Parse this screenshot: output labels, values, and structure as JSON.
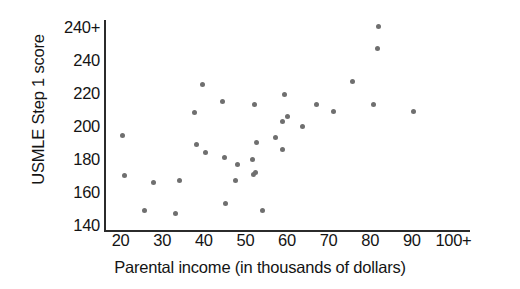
{
  "chart_data": {
    "type": "scatter",
    "title": "",
    "xlabel": "Parental income (in thousands of dollars)",
    "ylabel": "USMLE Step 1 score",
    "xticks": [
      "20",
      "30",
      "40",
      "50",
      "60",
      "70",
      "80",
      "90",
      "100+"
    ],
    "xtick_values": [
      20,
      30,
      40,
      50,
      60,
      70,
      80,
      90,
      100
    ],
    "yticks": [
      "140",
      "160",
      "180",
      "200",
      "220",
      "240",
      "240+"
    ],
    "ytick_values": [
      140,
      160,
      180,
      200,
      220,
      240,
      260
    ],
    "xlim": [
      16,
      104
    ],
    "ylim": [
      136,
      264
    ],
    "grid": false,
    "legend": null,
    "marker": {
      "shape": "circle",
      "color": "#6f6f6f",
      "size_px": 5
    },
    "axis_color": "#2b2b2b",
    "background": "#ffffff",
    "points": [
      {
        "x": 20.5,
        "y": 194
      },
      {
        "x": 21.0,
        "y": 170
      },
      {
        "x": 25.8,
        "y": 149
      },
      {
        "x": 28.0,
        "y": 166
      },
      {
        "x": 33.2,
        "y": 147
      },
      {
        "x": 34.2,
        "y": 167
      },
      {
        "x": 37.8,
        "y": 208
      },
      {
        "x": 38.2,
        "y": 189
      },
      {
        "x": 39.8,
        "y": 225
      },
      {
        "x": 40.5,
        "y": 184
      },
      {
        "x": 44.5,
        "y": 215
      },
      {
        "x": 45.0,
        "y": 181
      },
      {
        "x": 45.2,
        "y": 153
      },
      {
        "x": 47.5,
        "y": 167
      },
      {
        "x": 48.2,
        "y": 177
      },
      {
        "x": 51.8,
        "y": 180
      },
      {
        "x": 51.9,
        "y": 171
      },
      {
        "x": 52.5,
        "y": 172
      },
      {
        "x": 52.3,
        "y": 213
      },
      {
        "x": 52.6,
        "y": 190
      },
      {
        "x": 54.0,
        "y": 149
      },
      {
        "x": 57.2,
        "y": 193
      },
      {
        "x": 58.8,
        "y": 203
      },
      {
        "x": 59.0,
        "y": 186
      },
      {
        "x": 59.5,
        "y": 219
      },
      {
        "x": 60.2,
        "y": 206
      },
      {
        "x": 63.8,
        "y": 200
      },
      {
        "x": 67.2,
        "y": 213
      },
      {
        "x": 71.2,
        "y": 209
      },
      {
        "x": 75.8,
        "y": 227
      },
      {
        "x": 80.8,
        "y": 213
      },
      {
        "x": 81.8,
        "y": 247
      },
      {
        "x": 82.0,
        "y": 260
      },
      {
        "x": 90.5,
        "y": 209
      }
    ]
  }
}
